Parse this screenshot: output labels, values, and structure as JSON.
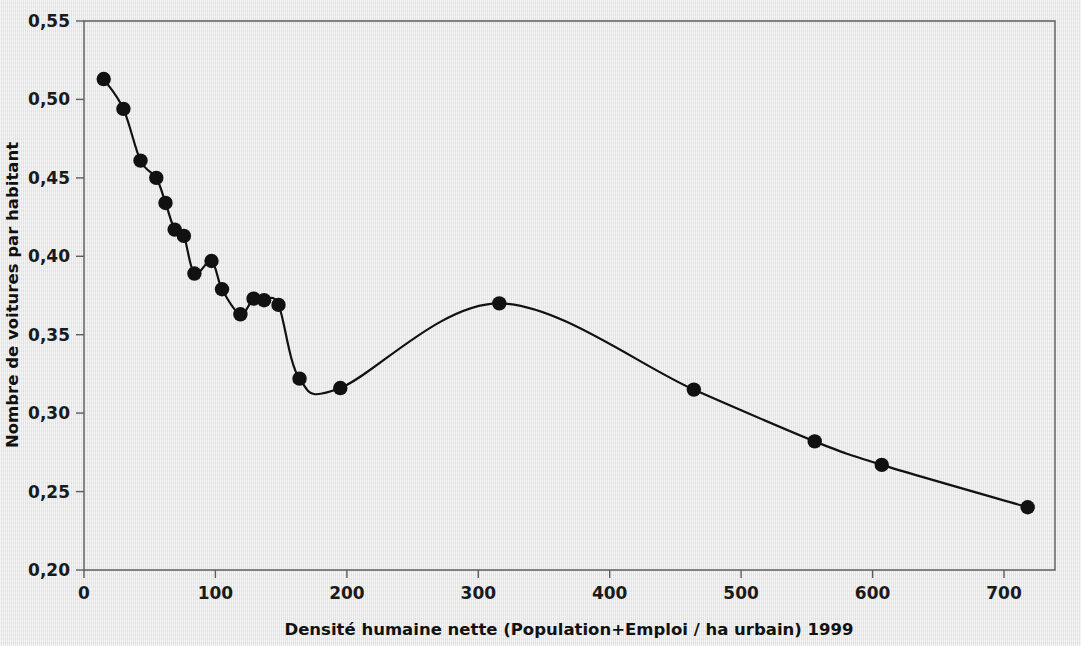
{
  "figure": {
    "background_color": "#e9e9e9",
    "ink_color": "#111111",
    "frame_color": "#5d5d5d"
  },
  "chart_data": {
    "type": "line",
    "title": "",
    "subtitle": "",
    "xlabel": "Densité humaine nette (Population+Emploi / ha urbain) 1999",
    "ylabel": "Nombre de voitures par habitant",
    "xlim": [
      0,
      740
    ],
    "ylim": [
      0.2,
      0.55
    ],
    "grid": false,
    "legend": null,
    "markers": "filled-circle",
    "smoothing": "spline-through-points",
    "xticks": [
      0,
      100,
      200,
      300,
      400,
      500,
      600,
      700
    ],
    "xtick_labels": [
      "0",
      "100",
      "200",
      "300",
      "400",
      "500",
      "600",
      "700"
    ],
    "yticks": [
      0.2,
      0.25,
      0.3,
      0.35,
      0.4,
      0.45,
      0.5,
      0.55
    ],
    "ytick_labels": [
      "0,20",
      "0,25",
      "0,30",
      "0,35",
      "0,40",
      "0,45",
      "0,50",
      "0,55"
    ],
    "series": [
      {
        "name": "Nombre de voitures par habitant",
        "x": [
          15,
          30,
          43,
          55,
          62,
          69,
          76,
          84,
          97,
          105,
          119,
          129,
          137,
          148,
          164,
          195,
          316,
          464,
          556,
          607,
          718
        ],
        "y": [
          0.513,
          0.494,
          0.461,
          0.45,
          0.434,
          0.417,
          0.413,
          0.389,
          0.397,
          0.379,
          0.363,
          0.373,
          0.372,
          0.369,
          0.322,
          0.316,
          0.37,
          0.315,
          0.282,
          0.267,
          0.24
        ]
      }
    ],
    "annotations": []
  },
  "axes": {
    "x_axis_label": "Densité humaine nette (Population+Emploi / ha urbain) 1999",
    "y_axis_label": "Nombre de voitures par habitant",
    "x_tick_0": "0",
    "x_tick_1": "100",
    "x_tick_2": "200",
    "x_tick_3": "300",
    "x_tick_4": "400",
    "x_tick_5": "500",
    "x_tick_6": "600",
    "x_tick_7": "700",
    "y_tick_0": "0,20",
    "y_tick_1": "0,25",
    "y_tick_2": "0,30",
    "y_tick_3": "0,35",
    "y_tick_4": "0,40",
    "y_tick_5": "0,45",
    "y_tick_6": "0,50",
    "y_tick_7": "0,55"
  }
}
